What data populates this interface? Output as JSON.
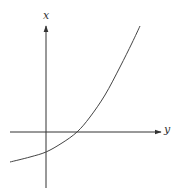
{
  "chart_data": {
    "type": "line",
    "title": "",
    "xlabel": "y",
    "ylabel": "x",
    "grid": false,
    "legend": null,
    "axes": {
      "horizontal_label": "y",
      "vertical_label": "x",
      "arrows": true,
      "ticks": []
    },
    "series": [
      {
        "name": "curve",
        "description": "Exponential-like increasing curve, concave up; negative x-intercept on vertical axis, crosses horizontal axis to the right of origin",
        "points_pixel": [
          [
            10,
            162
          ],
          [
            30,
            157
          ],
          [
            46,
            152
          ],
          [
            62,
            143
          ],
          [
            77,
            132
          ],
          [
            90,
            117
          ],
          [
            105,
            95
          ],
          [
            120,
            67
          ],
          [
            132,
            43
          ],
          [
            140,
            26
          ]
        ],
        "points_relative": [
          [
            -1.0,
            -0.8
          ],
          [
            -0.45,
            -0.7
          ],
          [
            0,
            -0.55
          ],
          [
            0.45,
            -0.3
          ],
          [
            0.85,
            0
          ],
          [
            1.2,
            0.4
          ],
          [
            1.6,
            1.0
          ],
          [
            2.0,
            1.75
          ],
          [
            2.35,
            2.4
          ],
          [
            2.55,
            2.85
          ]
        ]
      }
    ],
    "colors": {
      "axes": "#333333",
      "curve": "#444444",
      "background": "#ffffff"
    }
  },
  "labels": {
    "vertical_axis": "x",
    "horizontal_axis": "y"
  }
}
